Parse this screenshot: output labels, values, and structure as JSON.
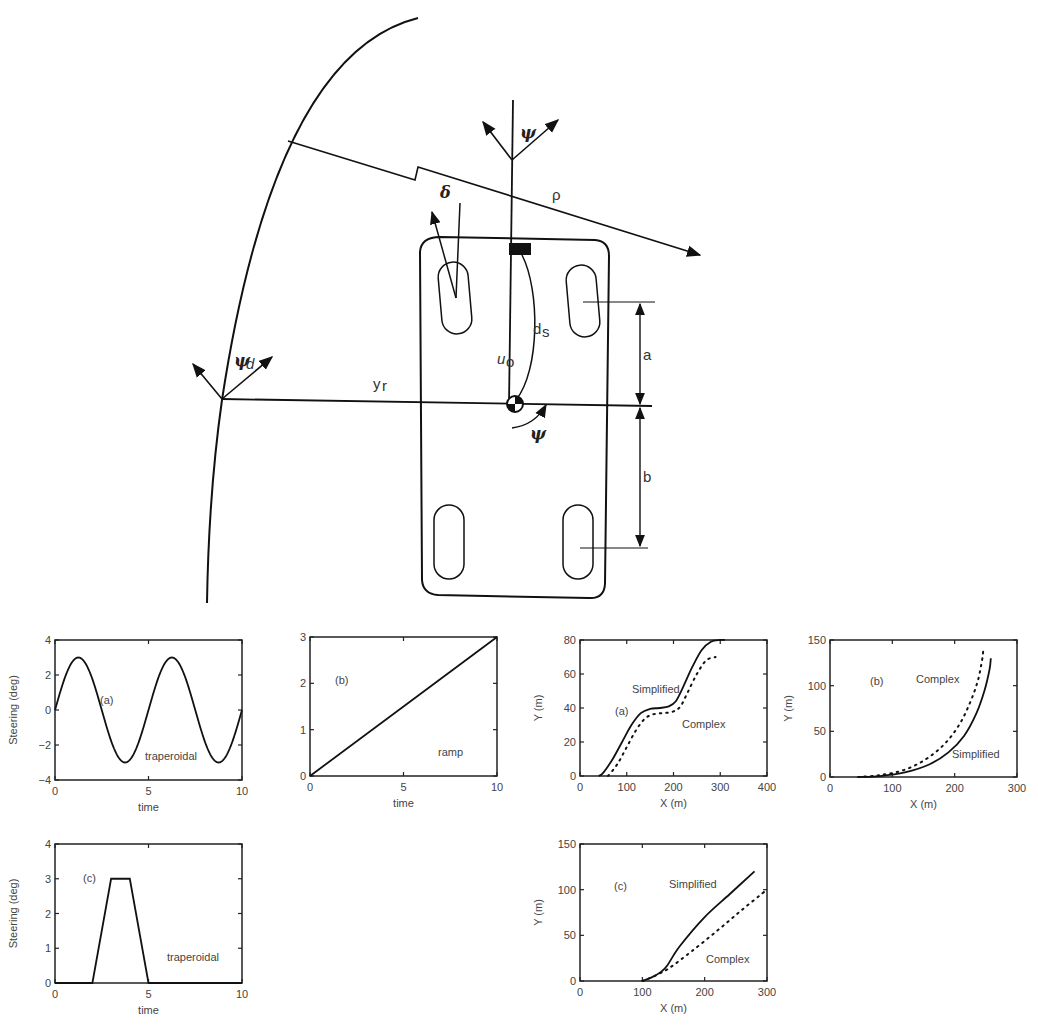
{
  "diagram": {
    "labels": {
      "psi_top": "ψ",
      "delta": "δ",
      "rho": "ρ",
      "psi_d": "ψ",
      "psi_d_sub": "d",
      "y_r": "y",
      "y_r_sub": "r",
      "u_o": "u",
      "u_o_sub": "o",
      "d_s": "d",
      "d_s_sub": "s",
      "psi_cg": "ψ",
      "a": "a",
      "b": "b"
    }
  },
  "chart_data": [
    {
      "id": "steering-a",
      "type": "line",
      "panel_label": "(a)",
      "annotation": "traperoidal",
      "xlabel": "time",
      "ylabel": "Steering (deg)",
      "xlim": [
        0,
        10
      ],
      "ylim": [
        -4,
        4
      ],
      "xticks": [
        "0",
        "5",
        "10"
      ],
      "yticks": [
        "4",
        "2",
        "0",
        "-2",
        "-4"
      ],
      "series": [
        {
          "name": "steering",
          "style": "solid",
          "function": "3*sin(2*pi*t/5)",
          "amplitude": 3,
          "period": 5
        }
      ]
    },
    {
      "id": "steering-b",
      "type": "line",
      "panel_label": "(b)",
      "annotation": "ramp",
      "xlabel": "time",
      "ylabel": "",
      "xlim": [
        0,
        10
      ],
      "ylim": [
        0,
        3
      ],
      "xticks": [
        "0",
        "5",
        "10"
      ],
      "yticks": [
        "3",
        "2",
        "1",
        "0"
      ],
      "series": [
        {
          "name": "steering",
          "style": "solid",
          "x": [
            0,
            10
          ],
          "y": [
            0,
            3
          ]
        }
      ]
    },
    {
      "id": "steering-c",
      "type": "line",
      "panel_label": "(c)",
      "annotation": "traperoidal",
      "xlabel": "time",
      "ylabel": "Steering (deg)",
      "xlim": [
        0,
        10
      ],
      "ylim": [
        0,
        4
      ],
      "xticks": [
        "0",
        "5",
        "10"
      ],
      "yticks": [
        "4",
        "3",
        "2",
        "1",
        "0"
      ],
      "series": [
        {
          "name": "steering",
          "style": "solid",
          "x": [
            0,
            2,
            3,
            4,
            5,
            10
          ],
          "y": [
            0,
            0,
            3,
            3,
            0,
            0
          ]
        }
      ]
    },
    {
      "id": "path-a",
      "type": "line",
      "panel_label": "(a)",
      "xlabel": "X (m)",
      "ylabel": "Y (m)",
      "xlim": [
        0,
        400
      ],
      "ylim": [
        0,
        80
      ],
      "xticks": [
        "0",
        "100",
        "200",
        "300",
        "400"
      ],
      "yticks": [
        "80",
        "60",
        "40",
        "20",
        "0"
      ],
      "series": [
        {
          "name": "Simplified",
          "style": "solid",
          "x": [
            40,
            50,
            70,
            90,
            110,
            130,
            150,
            170,
            190,
            205,
            220,
            240,
            260,
            280,
            300,
            310
          ],
          "y": [
            0,
            2,
            10,
            20,
            30,
            37,
            39.5,
            40,
            41,
            44,
            52,
            64,
            74,
            79,
            80,
            80
          ]
        },
        {
          "name": "Complex",
          "style": "dotted",
          "x": [
            60,
            80,
            100,
            120,
            140,
            160,
            180,
            200,
            215,
            230,
            250,
            270,
            290
          ],
          "y": [
            0,
            7,
            17,
            27,
            34,
            36.5,
            37,
            38,
            41,
            49,
            60,
            68,
            70
          ]
        }
      ]
    },
    {
      "id": "path-b",
      "type": "line",
      "panel_label": "(b)",
      "xlabel": "X (m)",
      "ylabel": "Y (m)",
      "xlim": [
        0,
        300
      ],
      "ylim": [
        0,
        150
      ],
      "xticks": [
        "0",
        "100",
        "200",
        "300"
      ],
      "yticks": [
        "150",
        "100",
        "50",
        "0"
      ],
      "series": [
        {
          "name": "Simplified",
          "style": "solid",
          "x": [
            45,
            80,
            120,
            160,
            190,
            215,
            235,
            248,
            256,
            258
          ],
          "y": [
            0,
            1,
            5,
            14,
            27,
            45,
            70,
            95,
            118,
            130
          ]
        },
        {
          "name": "Complex",
          "style": "dotted",
          "x": [
            45,
            80,
            120,
            155,
            185,
            208,
            225,
            237,
            244,
            246
          ],
          "y": [
            0,
            2,
            8,
            20,
            37,
            58,
            82,
            105,
            128,
            140
          ]
        }
      ]
    },
    {
      "id": "path-c",
      "type": "line",
      "panel_label": "(c)",
      "xlabel": "X (m)",
      "ylabel": "Y (m)",
      "xlim": [
        0,
        300
      ],
      "ylim": [
        0,
        150
      ],
      "xticks": [
        "0",
        "100",
        "200",
        "300"
      ],
      "yticks": [
        "150",
        "100",
        "50",
        "0"
      ],
      "series": [
        {
          "name": "Simplified",
          "style": "solid",
          "x": [
            100,
            115,
            130,
            140,
            160,
            200,
            240,
            280
          ],
          "y": [
            0,
            4,
            10,
            17,
            38,
            70,
            95,
            120
          ]
        },
        {
          "name": "Complex",
          "style": "dotted",
          "x": [
            100,
            115,
            130,
            145,
            180,
            220,
            260,
            300
          ],
          "y": [
            0,
            4,
            9,
            15,
            33,
            55,
            78,
            100
          ]
        }
      ]
    }
  ]
}
